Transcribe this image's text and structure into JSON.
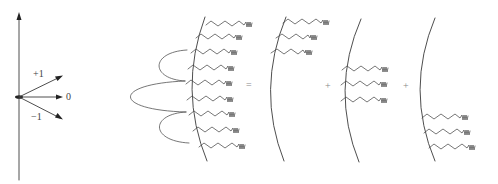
{
  "figure": {
    "stroke_color": "#3a3a3a"
  },
  "vector_diagram": {
    "origin": [
      19,
      97
    ],
    "axis": {
      "top": 13,
      "bottom": 180
    },
    "arrows": [
      {
        "label": "+1",
        "end": [
          62,
          76
        ]
      },
      {
        "label": "0",
        "end": [
          62,
          98
        ]
      },
      {
        "label": "−1",
        "end": [
          62,
          120
        ]
      }
    ],
    "labels": {
      "plus_one": "+1",
      "zero": "0",
      "minus_one": "−1"
    }
  },
  "equation": {
    "equals": "=",
    "plus_1": "+",
    "plus_2": "+"
  },
  "panels": [
    {
      "name": "full-membrane",
      "tail_count": 9,
      "has_lobes": true,
      "lobes": [
        "top",
        "middle",
        "bottom"
      ]
    },
    {
      "name": "top-component",
      "tail_count": 3,
      "position": "top"
    },
    {
      "name": "middle-component",
      "tail_count": 3,
      "position": "middle"
    },
    {
      "name": "bottom-component",
      "tail_count": 3,
      "position": "bottom"
    }
  ]
}
